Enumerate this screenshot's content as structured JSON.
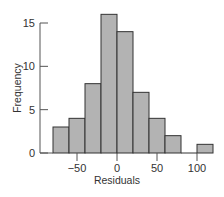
{
  "chart_data": {
    "type": "bar",
    "subtype": "histogram",
    "title": "",
    "xlabel": "Residuals",
    "ylabel": "Frequency",
    "bin_edges": [
      -80,
      -60,
      -40,
      -20,
      0,
      20,
      40,
      60,
      80,
      100,
      120
    ],
    "categories": [
      "-80 to -60",
      "-60 to -40",
      "-40 to -20",
      "-20 to 0",
      "0 to 20",
      "20 to 40",
      "40 to 60",
      "60 to 80",
      "80 to 100",
      "100 to 120"
    ],
    "values": [
      3,
      4,
      8,
      16,
      14,
      7,
      4,
      2,
      0,
      1
    ],
    "xticks": [
      -50,
      0,
      50,
      100
    ],
    "xtick_labels": [
      "−50",
      "0",
      "50",
      "100"
    ],
    "yticks": [
      0,
      5,
      10,
      15
    ],
    "ytick_labels": [
      "0",
      "5",
      "10",
      "15"
    ],
    "xlim": [
      -80,
      120
    ],
    "ylim": [
      0,
      16
    ],
    "grid": false,
    "legend": null,
    "bar_color": "#b3b3b3",
    "edge_color": "#333333"
  }
}
